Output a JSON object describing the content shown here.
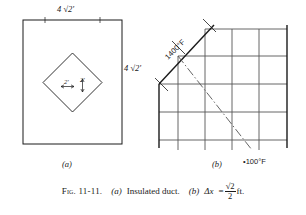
{
  "figure": {
    "caption": {
      "fig_number": "Fig. 11-11.",
      "part_a_letter": "(a)",
      "part_a_text": "Insulated duct.",
      "part_b_letter": "(b)",
      "part_b_var": "Δx",
      "equals": "=",
      "frac_numerator": "√2",
      "frac_denominator": "2",
      "units": "ft."
    },
    "panel_a": {
      "letter": "(a)",
      "outer_square_label_top": "4 √2′",
      "outer_square_label_right": "4 √2′",
      "inner_diamond_label_left": "2′",
      "inner_diamond_label_right": "2′"
    },
    "panel_b": {
      "letter": "(b)",
      "hot_boundary_temp": "1400°F",
      "cold_point_temp": "•100°F"
    }
  },
  "colors": {
    "ink": "#1a1a1a",
    "grid": "#555555",
    "paper": "#ffffff"
  }
}
